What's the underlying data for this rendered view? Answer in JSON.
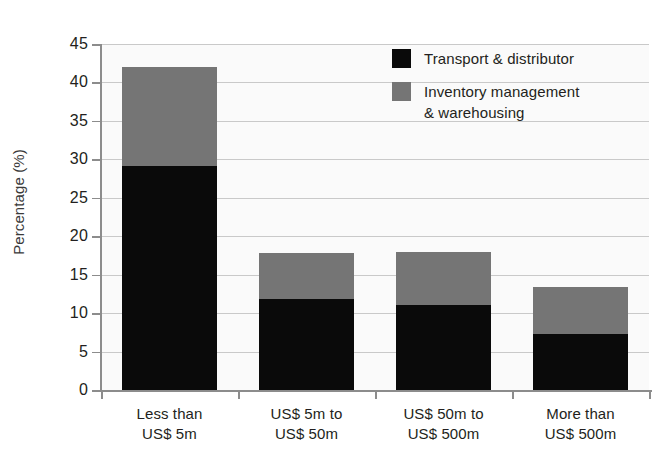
{
  "chart_data": {
    "type": "bar",
    "stacked": true,
    "title": "",
    "xlabel": "",
    "ylabel": "Percentage (%)",
    "ylim": [
      0,
      45
    ],
    "ytick_step": 5,
    "yticks": [
      "45",
      "40",
      "35",
      "30",
      "25",
      "20",
      "15",
      "10",
      "5",
      "0"
    ],
    "grid": true,
    "legend_position": "top-right",
    "categories": [
      "Less than\nUS$ 5m",
      "US$ 5m to\nUS$ 50m",
      "US$ 50m to\nUS$ 500m",
      "More than\nUS$ 500m"
    ],
    "series": [
      {
        "name": "Transport & distributor",
        "color": "#0a0a0a",
        "values": [
          29.2,
          11.8,
          11.0,
          7.3
        ]
      },
      {
        "name": "Inventory management & warehousing",
        "color": "#757575",
        "values": [
          12.8,
          6.0,
          7.0,
          6.1
        ]
      }
    ],
    "totals": [
      42.0,
      17.8,
      18.0,
      13.4
    ]
  },
  "legend": {
    "items": [
      {
        "label": "Transport & distributor",
        "color": "#0a0a0a"
      },
      {
        "label": "Inventory management\n& warehousing",
        "color": "#757575"
      }
    ]
  },
  "axis": {
    "y_title": "Percentage (%)"
  }
}
